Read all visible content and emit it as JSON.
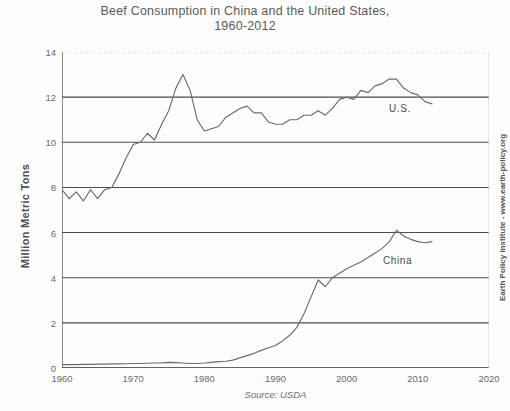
{
  "chart_data": {
    "type": "line",
    "title": "Beef Consumption in China and the United States,\n1960-2012",
    "xlabel": "",
    "ylabel": "Million Metric Tons",
    "source": "Source: USDA",
    "credit": "Earth Policy Institute - www.earth-policy.org",
    "grid": true,
    "legend_position": "inline-labels",
    "xlim": [
      1960,
      2020
    ],
    "ylim": [
      0,
      14
    ],
    "xticks": [
      1960,
      1970,
      1980,
      1990,
      2000,
      2010,
      2020
    ],
    "yticks": [
      0,
      2,
      4,
      6,
      8,
      10,
      12,
      14
    ],
    "xtick_labels": [
      "1960",
      "1970",
      "1980",
      "1990",
      "2000",
      "2010",
      "2020"
    ],
    "ytick_labels": [
      "0",
      "2",
      "4",
      "6",
      "8",
      "10",
      "12",
      "14"
    ],
    "line_color": "#6b6b6b",
    "x": [
      1960,
      1961,
      1962,
      1963,
      1964,
      1965,
      1966,
      1967,
      1968,
      1969,
      1970,
      1971,
      1972,
      1973,
      1974,
      1975,
      1976,
      1977,
      1978,
      1979,
      1980,
      1981,
      1982,
      1983,
      1984,
      1985,
      1986,
      1987,
      1988,
      1989,
      1990,
      1991,
      1992,
      1993,
      1994,
      1995,
      1996,
      1997,
      1998,
      1999,
      2000,
      2001,
      2002,
      2003,
      2004,
      2005,
      2006,
      2007,
      2008,
      2009,
      2010,
      2011,
      2012
    ],
    "series": [
      {
        "name": "U.S.",
        "label": "U.S.",
        "values": [
          7.9,
          7.5,
          7.8,
          7.4,
          7.9,
          7.5,
          7.9,
          8.0,
          8.6,
          9.3,
          9.9,
          10.0,
          10.4,
          10.1,
          10.8,
          11.4,
          12.4,
          13.0,
          12.3,
          11.0,
          10.5,
          10.6,
          10.7,
          11.1,
          11.3,
          11.5,
          11.6,
          11.3,
          11.3,
          10.9,
          10.8,
          10.8,
          11.0,
          11.0,
          11.2,
          11.2,
          11.4,
          11.2,
          11.5,
          11.9,
          12.0,
          11.9,
          12.3,
          12.2,
          12.5,
          12.6,
          12.8,
          12.8,
          12.4,
          12.2,
          12.1,
          11.8,
          11.7
        ]
      },
      {
        "name": "China",
        "label": "China",
        "values": [
          0.15,
          0.15,
          0.15,
          0.16,
          0.16,
          0.17,
          0.17,
          0.18,
          0.18,
          0.19,
          0.2,
          0.2,
          0.21,
          0.22,
          0.23,
          0.25,
          0.24,
          0.22,
          0.2,
          0.2,
          0.22,
          0.25,
          0.28,
          0.3,
          0.35,
          0.45,
          0.55,
          0.65,
          0.78,
          0.9,
          1.0,
          1.2,
          1.45,
          1.8,
          2.4,
          3.15,
          3.9,
          3.6,
          4.0,
          4.2,
          4.4,
          4.55,
          4.7,
          4.9,
          5.1,
          5.3,
          5.6,
          6.1,
          5.85,
          5.7,
          5.6,
          5.55,
          5.6
        ]
      }
    ]
  },
  "labels": {
    "us": "U.S.",
    "china": "China"
  }
}
